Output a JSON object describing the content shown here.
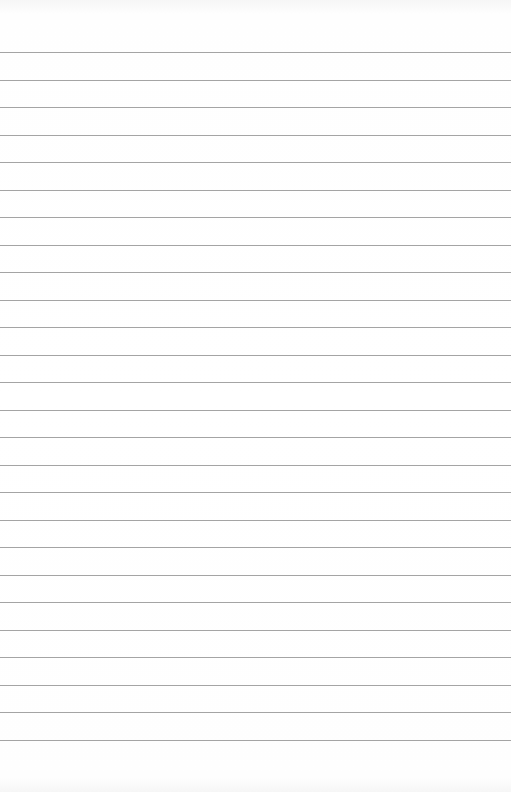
{
  "paper": {
    "type": "lined-notepaper",
    "background_color": "#ffffff",
    "rule_color": "#a4a4a4",
    "rule_count": 26,
    "first_rule_y": 52,
    "rule_spacing": 27.5
  }
}
